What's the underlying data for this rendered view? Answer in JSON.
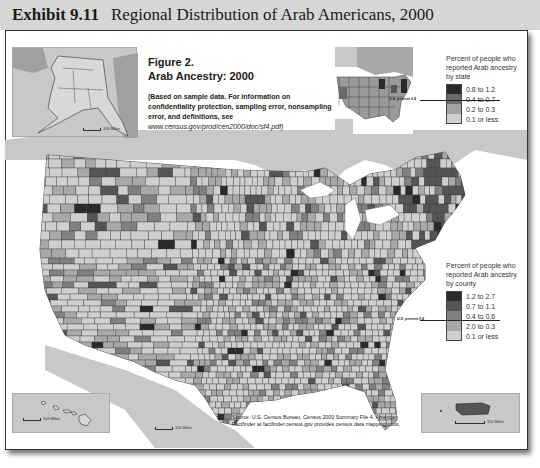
{
  "exhibit": {
    "number": "Exhibit 9.11",
    "title": "Regional Distribution of Arab Americans, 2000"
  },
  "figure": {
    "label": "Figure 2.",
    "title": "Arab Ancestry: 2000",
    "note": "(Based on sample data. For information on confidentiality protection, sampling error, nonsampling error, and definitions, see",
    "note_url": "www.census.gov/prod/cen2000/doc/sf4.pdf)"
  },
  "legend_state": {
    "title": "Percent of people who reported Arab ancestry by state",
    "us_marker": "U.S. percent 0.4",
    "classes": [
      {
        "label": "0.8 to 1.2",
        "color": "#2a2a2a"
      },
      {
        "label": "0.4 to 0.7",
        "color": "#6a6a6a"
      },
      {
        "label": "0.2 to 0.3",
        "color": "#a3a3a3"
      },
      {
        "label": "0.1 or less",
        "color": "#cfcfcf"
      }
    ]
  },
  "legend_county": {
    "title": "Percent of people who reported Arab ancestry by county",
    "us_marker": "U.S. percent 0.4",
    "classes": [
      {
        "label": "1.2 to 2.7",
        "color": "#2a2a2a"
      },
      {
        "label": "0.7 to 1.1",
        "color": "#555555"
      },
      {
        "label": "0.4 to 0.6",
        "color": "#808080"
      },
      {
        "label": "2.0 to 0.3",
        "color": "#a8a8a8"
      },
      {
        "label": "0.1 or less",
        "color": "#cfcfcf"
      }
    ]
  },
  "insets": {
    "alaska_scale": "100 Miles",
    "hawaii_scale": "100 Miles",
    "puerto_rico_scale": "100 Miles",
    "main_scale": "100 Miles",
    "scale_zero": "0"
  },
  "source": "Source: U.S. Census Bureau, Census 2000 Summary File 4. American Factfinder at factfinder.census.gov provides census data mapping tools.",
  "colors": {
    "header_bg": "#d6d6d6",
    "land_foreign": "#c8c8c8",
    "water": "#ffffff",
    "county_border": "#3a3a3a"
  }
}
